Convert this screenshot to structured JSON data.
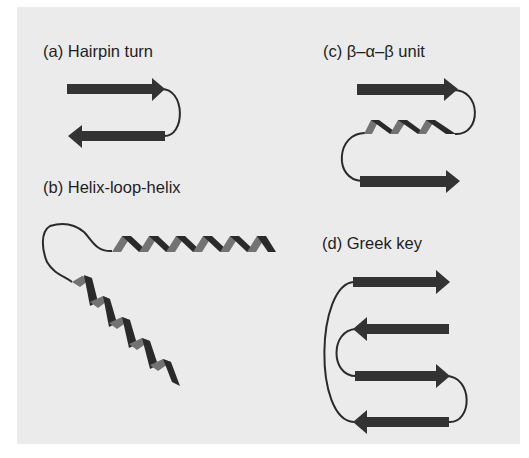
{
  "figure": {
    "background_color": "#ebebeb",
    "strand_color": "#333333",
    "helix_front_color": "#2a2a2a",
    "helix_back_color": "#737373",
    "loop_color": "#2a2a2a"
  },
  "panels": [
    {
      "id": "a",
      "label": "(a) Hairpin turn",
      "elements": [
        "beta-strand (right)",
        "loop",
        "beta-strand (left)"
      ]
    },
    {
      "id": "b",
      "label": "(b) Helix-loop-helix",
      "elements": [
        "alpha-helix (diagonal)",
        "loop",
        "alpha-helix (horizontal)"
      ]
    },
    {
      "id": "c",
      "label": "(c) β–α–β unit",
      "elements": [
        "beta-strand (right)",
        "loop",
        "alpha-helix",
        "loop",
        "beta-strand (right)"
      ]
    },
    {
      "id": "d",
      "label": "(d) Greek key",
      "elements": [
        "beta-strand 1 (right)",
        "beta-strand 2 (left)",
        "beta-strand 3 (right)",
        "beta-strand 4 (left)",
        "connecting loops"
      ]
    }
  ]
}
